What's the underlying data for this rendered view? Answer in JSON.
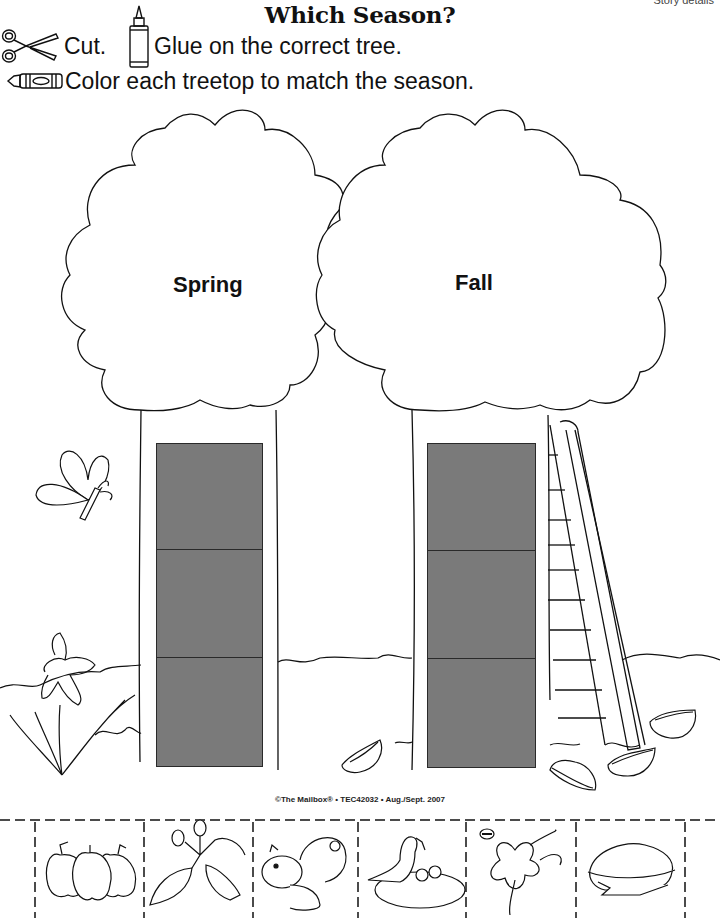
{
  "header": {
    "story_label": "Story details",
    "title": "Which Season?",
    "instructions": {
      "cut": "Cut.",
      "glue": "Glue on the correct tree.",
      "color": "Color each treetop to match the season."
    },
    "icons": [
      "scissors-icon",
      "glue-bottle-icon",
      "crayon-icon"
    ]
  },
  "trees": [
    {
      "label": "Spring",
      "slots": 3,
      "slot_color": "#7a7a7a"
    },
    {
      "label": "Fall",
      "slots": 3,
      "slot_color": "#7a7a7a"
    }
  ],
  "decorations": [
    "butterfly",
    "daffodil",
    "ladder",
    "fallen-leaves",
    "grass"
  ],
  "footer": {
    "copyright": "©The Mailbox® • TEC42032 • Aug./Sept. 2007"
  },
  "cutouts": [
    {
      "name": "apples"
    },
    {
      "name": "leaf-buds"
    },
    {
      "name": "squirrel"
    },
    {
      "name": "bird-nest"
    },
    {
      "name": "bee-flower"
    },
    {
      "name": "pie"
    }
  ]
}
